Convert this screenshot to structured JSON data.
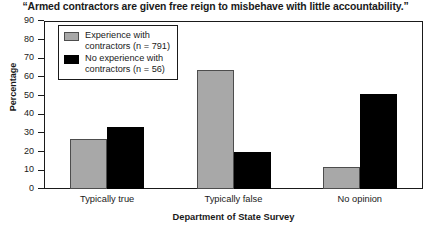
{
  "chart_data": {
    "type": "bar",
    "title": "“Armed contractors are given free reign to misbehave with little accountability.”",
    "xlabel": "Department of State Survey",
    "ylabel": "Percentage",
    "categories": [
      "Typically true",
      "Typically false",
      "No opinion"
    ],
    "series": [
      {
        "name": "Experience with contractors (n = 791)",
        "color": "#a8a8a8",
        "values": [
          27,
          64,
          12
        ]
      },
      {
        "name": "No experience with contractors (n = 56)",
        "color": "#000000",
        "values": [
          33,
          20,
          51
        ]
      }
    ],
    "ylim": [
      0,
      90
    ],
    "yticks": [
      90,
      80,
      70,
      60,
      50,
      40,
      30,
      20,
      10,
      0
    ],
    "grid": false,
    "legend_position": "top-left"
  },
  "legend": {
    "entries": [
      {
        "label": "Experience with\ncontractors (n = 791)",
        "swatch": "gray-swatch"
      },
      {
        "label": "No experience with\ncontractors (n = 56)",
        "swatch": "black-swatch"
      }
    ]
  }
}
